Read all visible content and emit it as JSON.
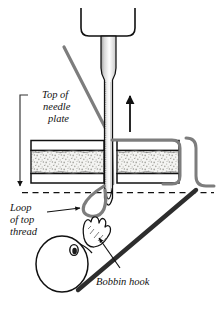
{
  "figure": {
    "colors": {
      "outline": "#111111",
      "thread": "#7d7d7d",
      "thread_dark": "#6e6e6e",
      "batting_fill": "#f2f2f0",
      "batting_speckle": "#9a9a96",
      "fabric_fill": "#ffffff",
      "background": "#ffffff",
      "needle_shade": "#b8b8b8",
      "arrow": "#111111",
      "leader": "#444444"
    }
  },
  "labels": {
    "needle_plate": {
      "line1": "Top of",
      "line2": "needle",
      "line3": "plate"
    },
    "loop_of_top_thread": {
      "line1": "Loop",
      "line2": "of top",
      "line3": "thread"
    },
    "bobbin_hook": {
      "line1": "Bobbin hook"
    }
  },
  "parts": {
    "needle_clamp": "needle-clamp",
    "needle_shaft": "needle-shaft",
    "needle_tip": "needle-tip",
    "fabric_top_layer": "quilt-top-fabric",
    "fabric_batting": "quilt-batting",
    "fabric_backing": "quilt-backing",
    "needle_plate_line": "needle-plate-level-dashed-line",
    "top_thread": "top-thread",
    "thread_loop": "loop-of-top-thread",
    "bobbin_body": "bobbin-hook-body",
    "bobbin_point": "bobbin-hook-point",
    "direction_arrow": "needle-travel-up-arrow",
    "plate_leader": "needle-plate-leader-arrow",
    "loop_leader": "loop-leader-arrow",
    "hook_leader": "bobbin-hook-leader-arrow"
  }
}
